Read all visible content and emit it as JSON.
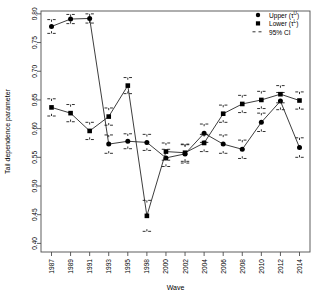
{
  "chart_data": {
    "type": "line",
    "title": "",
    "xlabel": "Wave",
    "ylabel": "Tail dependence parameter",
    "categories": [
      "1987",
      "1989",
      "1991",
      "1993",
      "1995",
      "1998",
      "2000",
      "2002",
      "2004",
      "2006",
      "2008",
      "2010",
      "2012",
      "2014"
    ],
    "ylim": [
      0.385,
      0.805
    ],
    "yticks": [
      0.4,
      0.45,
      0.5,
      0.55,
      0.6,
      0.65,
      0.7,
      0.75,
      0.8
    ],
    "ytick_labels": [
      "0.40",
      "0.45",
      "0.50",
      "0.55",
      "0.60",
      "0.65",
      "0.70",
      "0.75",
      "0.80"
    ],
    "grid": false,
    "legend_position": "top-right",
    "series": [
      {
        "name": "Upper",
        "symbol": "filled-circle",
        "values": [
          0.778,
          0.791,
          0.792,
          0.573,
          0.578,
          0.576,
          0.549,
          0.556,
          0.592,
          0.573,
          0.564,
          0.611,
          0.648,
          0.567
        ],
        "ci_lower": [
          0.766,
          0.783,
          0.784,
          0.557,
          0.565,
          0.562,
          0.534,
          0.54,
          0.576,
          0.557,
          0.548,
          0.595,
          0.633,
          0.55
        ],
        "ci_upper": [
          0.79,
          0.799,
          0.8,
          0.589,
          0.591,
          0.59,
          0.564,
          0.572,
          0.608,
          0.589,
          0.58,
          0.627,
          0.663,
          0.584
        ]
      },
      {
        "name": "Lower",
        "symbol": "filled-square",
        "values": [
          0.637,
          0.627,
          0.596,
          0.621,
          0.675,
          0.448,
          0.56,
          0.558,
          0.575,
          0.626,
          0.643,
          0.65,
          0.66,
          0.649
        ],
        "ci_lower": [
          0.622,
          0.612,
          0.581,
          0.606,
          0.661,
          0.421,
          0.545,
          0.543,
          0.56,
          0.611,
          0.628,
          0.635,
          0.645,
          0.634
        ],
        "ci_upper": [
          0.652,
          0.642,
          0.611,
          0.636,
          0.689,
          0.475,
          0.575,
          0.573,
          0.59,
          0.641,
          0.658,
          0.665,
          0.675,
          0.664
        ]
      }
    ]
  },
  "legend": {
    "items": [
      {
        "label_main": "Upper (τ",
        "label_sup": "U",
        "label_tail": ")",
        "marker": "filled-circle"
      },
      {
        "label_main": "Lower (τ",
        "label_sup": "L",
        "label_tail": ")",
        "marker": "filled-square"
      },
      {
        "label_main": "95% CI",
        "label_sup": "",
        "label_tail": "",
        "marker": "dashed-line"
      }
    ]
  },
  "style": {
    "line_color": "#1a1a1a",
    "point_color": "#000000",
    "axis_color": "#4d4d4d",
    "background": "#ffffff"
  }
}
